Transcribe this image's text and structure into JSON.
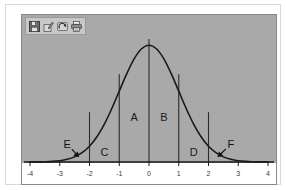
{
  "window": {
    "title": "Bell Curve Regions"
  },
  "toolbar": {
    "name": "chart-toolbar",
    "buttons": [
      {
        "id": "save",
        "icon": "save-floppy-icon",
        "label": "Save"
      },
      {
        "id": "edit",
        "icon": "pencil-edit-icon",
        "label": "Edit"
      },
      {
        "id": "refresh",
        "icon": "refresh-undo-icon",
        "label": "Refresh"
      },
      {
        "id": "print",
        "icon": "print-icon",
        "label": "Print"
      }
    ]
  },
  "colors": {
    "plot_background": "#a9a9a9",
    "curve": "#1a1a1a",
    "axis": "#1a1a1a",
    "divider": "#2b2b2b",
    "page_background": "#ffffff",
    "frame_border": "#8a8a8a",
    "outer_border": "#d8d8d8",
    "toolbar_background": "#c8c8c8",
    "label_text": "#1a1a1a"
  },
  "chart_data": {
    "type": "line",
    "title": "",
    "subtitle": "",
    "xlabel": "",
    "ylabel": "",
    "xlim": [
      -4,
      4
    ],
    "ylim": [
      0,
      0.42
    ],
    "grid": false,
    "legend_position": "none",
    "curve_name": "standard-normal-distribution",
    "x_ticks": [
      -4,
      -3,
      -2,
      -1,
      0,
      1,
      2,
      3,
      4
    ],
    "x_tick_labels": [
      "-4",
      "-3",
      "-2",
      "-1",
      "0",
      "1",
      "2",
      "3",
      "4"
    ],
    "y_ticks": [],
    "y_tick_labels": [],
    "series": [
      {
        "name": "standard normal pdf",
        "x": [
          -4,
          -3.75,
          -3.5,
          -3.25,
          -3,
          -2.75,
          -2.5,
          -2.25,
          -2,
          -1.75,
          -1.5,
          -1.25,
          -1,
          -0.75,
          -0.5,
          -0.25,
          0,
          0.25,
          0.5,
          0.75,
          1,
          1.25,
          1.5,
          1.75,
          2,
          2.25,
          2.5,
          2.75,
          3,
          3.25,
          3.5,
          3.75,
          4
        ],
        "y": [
          0.0001,
          0.0004,
          0.0009,
          0.002,
          0.0044,
          0.0091,
          0.0175,
          0.0317,
          0.054,
          0.0863,
          0.1295,
          0.1826,
          0.242,
          0.3011,
          0.3521,
          0.3867,
          0.3989,
          0.3867,
          0.3521,
          0.3011,
          0.242,
          0.1826,
          0.1295,
          0.0863,
          0.054,
          0.0317,
          0.0175,
          0.0091,
          0.0044,
          0.002,
          0.0009,
          0.0004,
          0.0001
        ]
      }
    ],
    "vertical_dividers": [
      {
        "x": -2,
        "top_y": 0.17,
        "name": "divider-minus-2"
      },
      {
        "x": -1,
        "top_y": 0.3,
        "name": "divider-minus-1"
      },
      {
        "x": 0,
        "top_y": 0.42,
        "name": "divider-zero"
      },
      {
        "x": 1,
        "top_y": 0.3,
        "name": "divider-plus-1"
      },
      {
        "x": 2,
        "top_y": 0.17,
        "name": "divider-plus-2"
      }
    ],
    "region_labels": [
      {
        "text": "A",
        "x": -0.5,
        "y": 0.155,
        "name": "region-label-a"
      },
      {
        "text": "B",
        "x": 0.5,
        "y": 0.155,
        "name": "region-label-b"
      },
      {
        "text": "C",
        "x": -1.5,
        "y": 0.035,
        "name": "region-label-c"
      },
      {
        "text": "D",
        "x": 1.5,
        "y": 0.035,
        "name": "region-label-d"
      }
    ],
    "annotations": [
      {
        "text": "E",
        "name": "callout-e",
        "label_x": -2.75,
        "label_y": 0.062,
        "arrow_to_x": -2.35,
        "arrow_to_y": 0.016
      },
      {
        "text": "F",
        "name": "callout-f",
        "label_x": 2.75,
        "label_y": 0.062,
        "arrow_to_x": 2.3,
        "arrow_to_y": 0.016
      }
    ]
  }
}
